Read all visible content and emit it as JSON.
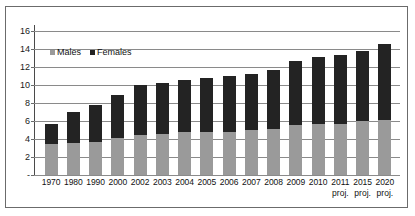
{
  "chart_data": {
    "type": "bar",
    "stacked": true,
    "title": "",
    "subtitle": "",
    "xlabel": "",
    "ylabel": "",
    "ylim": [
      0,
      16.667
    ],
    "yticks": [
      "-",
      "2",
      "4",
      "6",
      "8",
      "10",
      "12",
      "14",
      "16"
    ],
    "ytick_values": [
      0,
      2,
      4,
      6,
      8,
      10,
      12,
      14,
      16
    ],
    "grid": true,
    "legend_position": "inside-top-left",
    "categories": [
      "1970",
      "1980",
      "1990",
      "2000",
      "2002",
      "2003",
      "2004",
      "2005",
      "2006",
      "2007",
      "2008",
      "2009",
      "2010",
      "2011",
      "2015",
      "2020"
    ],
    "category_notes": [
      "",
      "",
      "",
      "",
      "",
      "",
      "",
      "",
      "",
      "",
      "",
      "",
      "",
      "proj.",
      "proj.",
      "proj."
    ],
    "series": [
      {
        "name": "Males",
        "color": "#9a9a9a",
        "values": [
          3.4,
          3.6,
          3.7,
          4.1,
          4.4,
          4.6,
          4.8,
          4.8,
          4.8,
          5.0,
          5.1,
          5.6,
          5.7,
          5.7,
          6.0,
          6.1
        ]
      },
      {
        "name": "Females",
        "color": "#232323",
        "values": [
          2.3,
          3.4,
          4.1,
          4.8,
          5.6,
          5.6,
          5.8,
          6.0,
          6.2,
          6.2,
          6.6,
          7.1,
          7.4,
          7.6,
          7.8,
          8.5
        ]
      }
    ],
    "totals": [
      5.7,
      7.0,
      7.8,
      8.9,
      10.0,
      10.2,
      10.6,
      10.8,
      11.0,
      11.2,
      11.7,
      12.7,
      13.1,
      13.3,
      13.8,
      14.6
    ]
  },
  "legend": {
    "items": [
      {
        "label": "Males",
        "color": "#9a9a9a"
      },
      {
        "label": "Females",
        "color": "#232323"
      }
    ]
  }
}
